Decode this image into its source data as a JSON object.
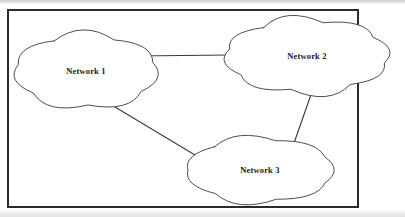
{
  "figure": {
    "kind": "network-topology-diagram",
    "frame": {
      "border_color": "#2b2b2b",
      "background_color": "#ffffff"
    },
    "stroke_color": "#3a3a3a",
    "label_color": "#1a1a1a"
  },
  "nodes": [
    {
      "id": "network-1",
      "label": "Network 1",
      "shape": "cloud",
      "center": {
        "x": 86,
        "y": 71
      },
      "radius": {
        "x": 69,
        "y": 34
      }
    },
    {
      "id": "network-2",
      "label": "Network 2",
      "shape": "cloud",
      "center": {
        "x": 307,
        "y": 56
      },
      "radius": {
        "x": 79,
        "y": 34
      }
    },
    {
      "id": "network-3",
      "label": "Network 3",
      "shape": "cloud",
      "center": {
        "x": 260,
        "y": 170
      },
      "radius": {
        "x": 72,
        "y": 30
      }
    }
  ],
  "links": [
    {
      "id": "link-network1-network2",
      "from": "network-1",
      "to": "network-2",
      "from_point": {
        "x": 135,
        "y": 56
      },
      "to_point": {
        "x": 229,
        "y": 55
      }
    },
    {
      "id": "link-network1-network3",
      "from": "network-1",
      "to": "network-3",
      "from_point": {
        "x": 105,
        "y": 101
      },
      "to_point": {
        "x": 200,
        "y": 158
      }
    },
    {
      "id": "link-network2-network3",
      "from": "network-2",
      "to": "network-3",
      "from_point": {
        "x": 313,
        "y": 89
      },
      "to_point": {
        "x": 294,
        "y": 143
      }
    }
  ]
}
